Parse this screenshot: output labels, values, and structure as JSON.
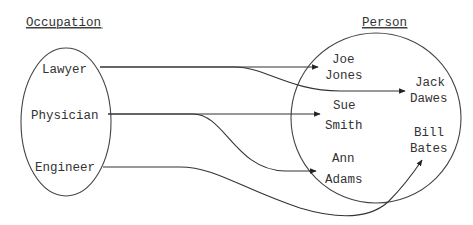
{
  "diagram": {
    "type": "mapping",
    "domain_set": {
      "title": "Occupation",
      "items": [
        "Lawyer",
        "Physician",
        "Engineer"
      ]
    },
    "codomain_set": {
      "title": "Person",
      "items": [
        {
          "first": "Joe",
          "last": "Jones"
        },
        {
          "first": "Jack",
          "last": "Dawes"
        },
        {
          "first": "Sue",
          "last": "Smith"
        },
        {
          "first": "Bill",
          "last": "Bates"
        },
        {
          "first": "Ann",
          "last": "Adams"
        }
      ]
    },
    "mappings": [
      {
        "from": "Lawyer",
        "to": "Joe Jones"
      },
      {
        "from": "Lawyer",
        "to": "Jack Dawes"
      },
      {
        "from": "Physician",
        "to": "Sue Smith"
      },
      {
        "from": "Physician",
        "to": "Ann Adams"
      },
      {
        "from": "Engineer",
        "to": "Bill Bates"
      }
    ],
    "colors": {
      "stroke": "#444444",
      "text": "#333333",
      "background": "#ffffff"
    }
  }
}
